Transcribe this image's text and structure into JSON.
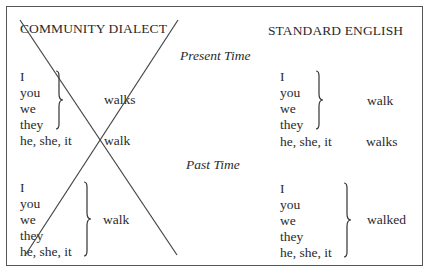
{
  "table": {
    "columns": {
      "left": "COMMUNITY DIALECT",
      "right": "STANDARD ENGLISH"
    },
    "sections": [
      {
        "label": "Present Time",
        "community_dialect": {
          "group_pronouns": [
            "I",
            "you",
            "we",
            "they"
          ],
          "group_verb": "walks",
          "single_pronoun": "he, she, it",
          "single_verb": "walk"
        },
        "standard_english": {
          "group_pronouns": [
            "I",
            "you",
            "we",
            "they"
          ],
          "group_verb": "walk",
          "single_pronoun": "he, she, it",
          "single_verb": "walks"
        }
      },
      {
        "label": "Past Time",
        "community_dialect": {
          "group_pronouns": [
            "I",
            "you",
            "we",
            "they",
            "he, she, it"
          ],
          "group_verb": "walk"
        },
        "standard_english": {
          "group_pronouns": [
            "I",
            "you",
            "we",
            "they",
            "he, she, it"
          ],
          "group_verb": "walked"
        }
      }
    ],
    "crossed_out": "community dialect column",
    "colors": {
      "text": "#2a2a2a",
      "border": "#555555",
      "cross": "#444444"
    }
  }
}
